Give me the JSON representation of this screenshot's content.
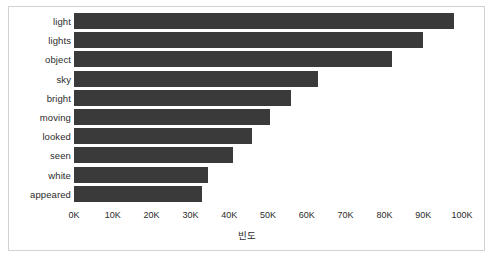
{
  "chart_data": {
    "type": "bar",
    "orientation": "horizontal",
    "title": "",
    "xlabel": "빈도",
    "ylabel": "",
    "categories": [
      "light",
      "lights",
      "object",
      "sky",
      "bright",
      "moving",
      "looked",
      "seen",
      "white",
      "appeared"
    ],
    "values": [
      98000,
      90000,
      82000,
      63000,
      56000,
      50500,
      46000,
      41000,
      34500,
      33000
    ],
    "xlim": [
      0,
      100000
    ],
    "xticks": [
      0,
      10000,
      20000,
      30000,
      40000,
      50000,
      60000,
      70000,
      80000,
      90000,
      100000
    ],
    "xtick_labels": [
      "0K",
      "10K",
      "20K",
      "30K",
      "40K",
      "50K",
      "60K",
      "70K",
      "80K",
      "90K",
      "100K"
    ],
    "grid": false,
    "legend": null,
    "bar_color": "#3a3a3a",
    "background_color": "#ffffff",
    "border_color": "#d2d2d2",
    "text_color": "#2b2b2b"
  }
}
